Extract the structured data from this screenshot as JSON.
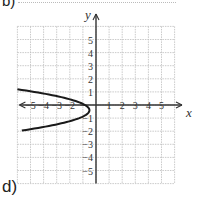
{
  "labels": {
    "top_part": "b)",
    "part": "d)",
    "x_axis": "x",
    "y_axis": "y"
  },
  "chart_data": {
    "type": "line",
    "title": "",
    "xlabel": "x",
    "ylabel": "y",
    "xlim": [
      -6,
      6
    ],
    "ylim": [
      -6,
      6
    ],
    "grid": true,
    "x_ticks": [
      -5,
      -4,
      -3,
      -2,
      -1,
      1,
      2,
      3,
      4,
      5
    ],
    "x_tick_labels": [
      "−5",
      "−4",
      "−3",
      "−2",
      "−",
      "1",
      "2",
      "3",
      "4",
      "5"
    ],
    "y_ticks": [
      5,
      4,
      3,
      2,
      1,
      -1,
      -2,
      -3,
      -4,
      -5
    ],
    "y_tick_labels": [
      "5",
      "4",
      "3",
      "2",
      "1",
      "−1",
      "−2",
      "−3",
      "−4",
      "−5"
    ],
    "series": [
      {
        "name": "parabola opening left",
        "description": "Horizontal parabola with vertex near (-0.5, -0.4), opening to the left",
        "vertex": [
          -0.5,
          -0.4
        ],
        "points": [
          [
            -6.0,
            1.2
          ],
          [
            -5.0,
            1.0
          ],
          [
            -4.0,
            0.8
          ],
          [
            -3.0,
            0.6
          ],
          [
            -2.0,
            0.3
          ],
          [
            -1.0,
            0.1
          ],
          [
            -0.5,
            -0.4
          ],
          [
            -1.0,
            -0.9
          ],
          [
            -2.0,
            -1.1
          ],
          [
            -3.0,
            -1.4
          ],
          [
            -4.0,
            -1.6
          ],
          [
            -5.0,
            -1.8
          ],
          [
            -6.0,
            -2.0
          ]
        ],
        "color": "#222222"
      }
    ]
  },
  "colors": {
    "grid": "#bdbdbd",
    "axis": "#333333",
    "curve": "#1a1a1a"
  }
}
